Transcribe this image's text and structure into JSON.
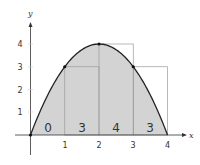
{
  "chart_data": {
    "type": "area",
    "title": "",
    "xlabel": "x",
    "ylabel": "y",
    "xlim": [
      0,
      4
    ],
    "ylim": [
      0,
      4
    ],
    "x_ticks": [
      "1",
      "2",
      "3",
      "4"
    ],
    "y_ticks": [
      "1",
      "2",
      "3",
      "4"
    ],
    "grid": false,
    "legend": null,
    "function": "f(x) = 4x - x^2",
    "curve_points": [
      {
        "x": 0,
        "y": 0
      },
      {
        "x": 1,
        "y": 3
      },
      {
        "x": 2,
        "y": 4
      },
      {
        "x": 3,
        "y": 3
      },
      {
        "x": 4,
        "y": 0
      }
    ],
    "marked_points": [
      {
        "x": 0,
        "y": 0
      },
      {
        "x": 1,
        "y": 3
      },
      {
        "x": 2,
        "y": 4
      },
      {
        "x": 3,
        "y": 3
      }
    ],
    "rectangles": [
      {
        "x0": 0,
        "x1": 1,
        "height": 0,
        "label": "0"
      },
      {
        "x0": 1,
        "x1": 2,
        "height": 3,
        "label": "3"
      },
      {
        "x0": 2,
        "x1": 3,
        "height": 4,
        "label": "4"
      },
      {
        "x0": 3,
        "x1": 4,
        "height": 3,
        "label": "3"
      }
    ],
    "method": "left-endpoint Riemann sum",
    "colors": {
      "area_fill": "#d3d3d3",
      "curve": "#222222",
      "rect_stroke": "#9a9a9a",
      "axis": "#333333"
    }
  }
}
